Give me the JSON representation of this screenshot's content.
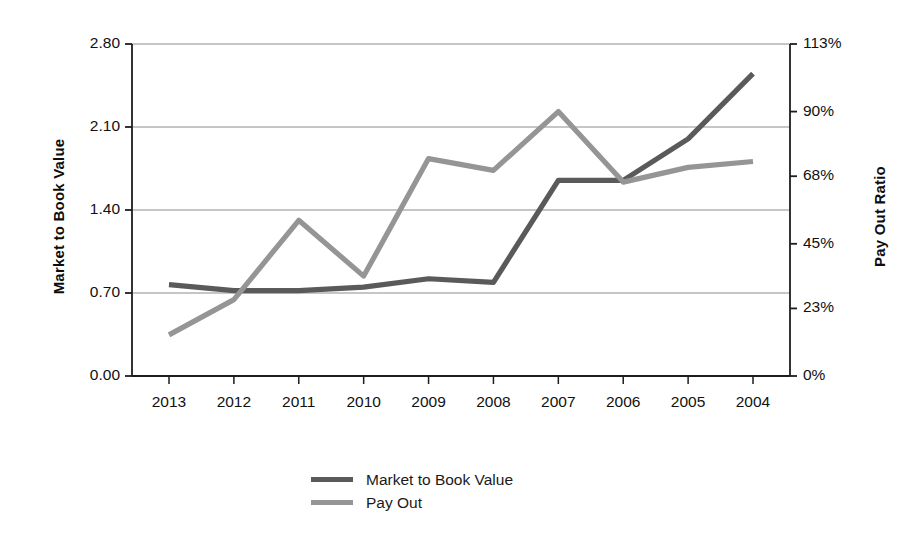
{
  "chart_data": {
    "type": "line",
    "title": "",
    "subtitle": "",
    "xlabel": "",
    "ylabel": "Market to Book Value",
    "y2label": "Pay Out Ratio",
    "categories": [
      "2013",
      "2012",
      "2011",
      "2010",
      "2009",
      "2008",
      "2007",
      "2006",
      "2005",
      "2004"
    ],
    "grid": true,
    "legend_position": "bottom-center",
    "ylim": [
      0.0,
      2.8
    ],
    "yticks": [
      0.0,
      0.7,
      1.4,
      2.1,
      2.8
    ],
    "ytick_labels": [
      "0.00",
      "0.70",
      "1.40",
      "2.10",
      "2.80"
    ],
    "y2lim": [
      0,
      113
    ],
    "y2ticks": [
      0,
      23,
      45,
      68,
      90,
      113
    ],
    "y2tick_labels": [
      "0%",
      "23%",
      "45%",
      "68%",
      "90%",
      "113%"
    ],
    "series": [
      {
        "name": "Market to Book Value",
        "axis": "left",
        "color": "#5a5a5a",
        "values": [
          0.77,
          0.72,
          0.72,
          0.75,
          0.82,
          0.79,
          1.65,
          1.65,
          2.0,
          2.55
        ]
      },
      {
        "name": "Pay Out",
        "axis": "right",
        "color": "#959595",
        "values": [
          14,
          26,
          53,
          34,
          74,
          70,
          90,
          66,
          71,
          73
        ]
      }
    ]
  },
  "axes": {
    "left_title": "Market to Book Value",
    "right_title": "Pay Out Ratio"
  },
  "legend": {
    "items": [
      {
        "label": "Market to Book Value",
        "color": "#5a5a5a"
      },
      {
        "label": "Pay Out",
        "color": "#959595"
      }
    ]
  }
}
